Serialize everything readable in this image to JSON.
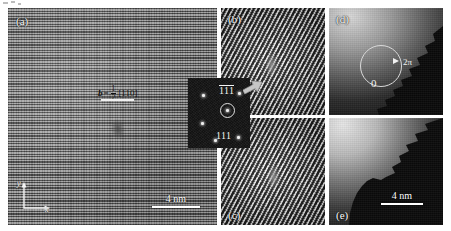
{
  "figure": {
    "type": "hrtem-micrograph-multipanel",
    "panel_count": 5
  },
  "panels": {
    "a": {
      "label": "(a)",
      "content": "atomic-resolution-lattice",
      "burgers": {
        "symbol": "b",
        "equals": "=",
        "numerator": "1",
        "denominator": "2",
        "direction": "[110]"
      },
      "axes": {
        "x_label": "x",
        "y_label": "y"
      },
      "scalebar": {
        "text": "4 nm"
      }
    },
    "b": {
      "label": "(b)",
      "content": "filtered-lattice-fringes"
    },
    "c": {
      "label": "(c)",
      "content": "filtered-lattice-fringes"
    },
    "d": {
      "label": "(d)",
      "content": "phase-map",
      "phase_start": "0",
      "phase_end": "2π"
    },
    "e": {
      "label": "(e)",
      "content": "amplitude-map",
      "scalebar": {
        "text": "4 nm"
      }
    }
  },
  "fft_inset": {
    "name": "diffractogram-inset",
    "label_top": "111",
    "label_bottom": "111",
    "spots": [
      {
        "x": 14,
        "y": 16
      },
      {
        "x": 38,
        "y": 31
      },
      {
        "x": 13,
        "y": 44
      },
      {
        "x": 49,
        "y": 58
      },
      {
        "x": 50,
        "y": 14
      },
      {
        "x": 26,
        "y": 61
      }
    ],
    "selected_spot": {
      "x": 38,
      "y": 31
    }
  },
  "colors": {
    "background": "#ffffff",
    "panel_base": "#8a8a8a",
    "annotation": "#ffffff",
    "dark_map": "#151515"
  }
}
